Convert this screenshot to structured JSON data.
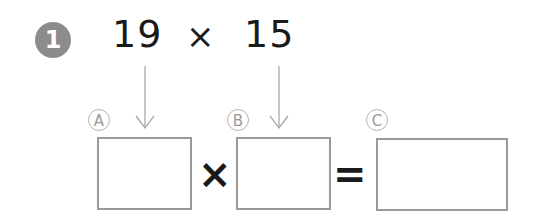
{
  "problem": {
    "number": "1",
    "operand_a": "19",
    "operator": "×",
    "operand_b": "15"
  },
  "labels": {
    "a": "A",
    "b": "B",
    "c": "C"
  },
  "equation": {
    "multiply_sign": "×",
    "equals_sign": "=",
    "box_a_value": "",
    "box_b_value": "",
    "box_c_value": ""
  },
  "colors": {
    "badge": "#8c8c8c",
    "box_border": "#9a9a9a",
    "arrow": "#a8a8a8",
    "text": "#1a1a1a"
  }
}
